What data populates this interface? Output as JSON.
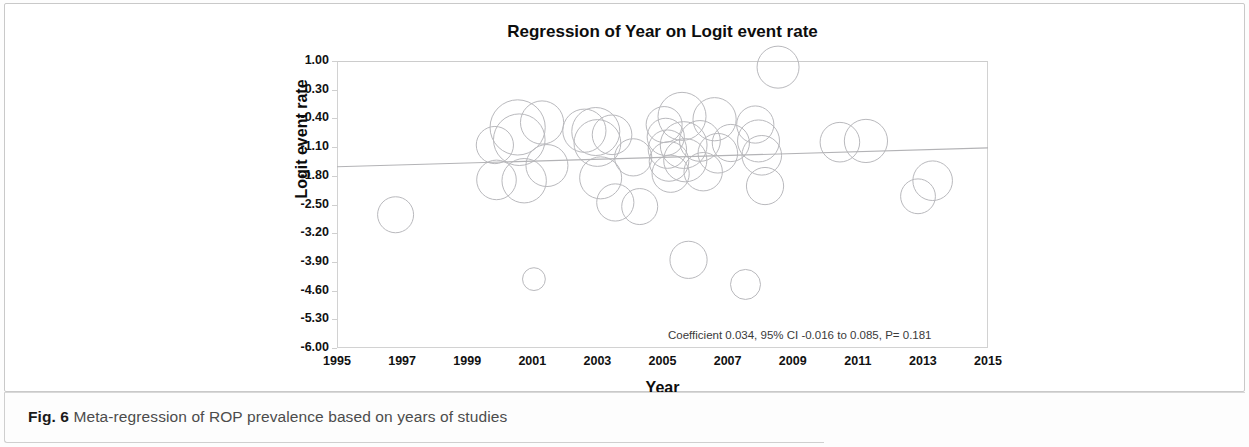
{
  "caption": {
    "label": "Fig. 6",
    "text": " Meta-regression of ROP prevalence based on years of studies"
  },
  "chart_data": {
    "type": "scatter",
    "title": "Regression of Year on Logit event rate",
    "xlabel": "Year",
    "ylabel": "Logit event rate",
    "xlim": [
      1995,
      2015
    ],
    "ylim": [
      -6.0,
      1.0
    ],
    "grid": false,
    "legend": null,
    "xticks": [
      1995,
      1997,
      1999,
      2001,
      2003,
      2005,
      2007,
      2009,
      2011,
      2013,
      2015
    ],
    "xtick_labels": [
      "1995",
      "1997",
      "1999",
      "2001",
      "2003",
      "2005",
      "2007",
      "2009",
      "2011",
      "2013",
      "2015"
    ],
    "yticks": [
      1.0,
      0.3,
      -0.4,
      -1.1,
      -1.8,
      -2.5,
      -3.2,
      -3.9,
      -4.6,
      -5.3,
      -6.0
    ],
    "ytick_labels": [
      "1.00",
      "0.30",
      "-0.40",
      "-1.10",
      "-1.80",
      "-2.50",
      "-3.20",
      "-3.90",
      "-4.60",
      "-5.30",
      "-6.00"
    ],
    "annotation": "Coefficient 0.034, 95% CI -0.016 to 0.085, P= 0.181",
    "statistics": {
      "coefficient": 0.034,
      "ci_lower": -0.016,
      "ci_upper": 0.085,
      "p_value": 0.181,
      "ci_level": "95%"
    },
    "regression_line": {
      "x": [
        1995,
        2015
      ],
      "y": [
        -1.58,
        -1.12
      ],
      "color": "#b3b3b6"
    },
    "marker_style": "open-circle",
    "marker_color": "#b9b9bd",
    "series_name": "Studies",
    "points": [
      {
        "x": 1996.8,
        "y": -2.75,
        "size": 0.6
      },
      {
        "x": 1999.85,
        "y": -1.05,
        "size": 0.62
      },
      {
        "x": 1999.9,
        "y": -1.9,
        "size": 0.66
      },
      {
        "x": 2000.55,
        "y": -0.62,
        "size": 0.92
      },
      {
        "x": 2000.6,
        "y": -0.92,
        "size": 0.86
      },
      {
        "x": 2000.75,
        "y": -1.92,
        "size": 0.74
      },
      {
        "x": 2001.05,
        "y": -4.32,
        "size": 0.38
      },
      {
        "x": 2001.3,
        "y": -0.5,
        "size": 0.72
      },
      {
        "x": 2001.45,
        "y": -1.55,
        "size": 0.7
      },
      {
        "x": 2002.6,
        "y": -0.7,
        "size": 0.72
      },
      {
        "x": 2002.95,
        "y": -0.72,
        "size": 0.8
      },
      {
        "x": 2003.0,
        "y": -1.0,
        "size": 0.78
      },
      {
        "x": 2003.1,
        "y": -1.85,
        "size": 0.7
      },
      {
        "x": 2003.45,
        "y": -0.8,
        "size": 0.66
      },
      {
        "x": 2003.55,
        "y": -2.45,
        "size": 0.62
      },
      {
        "x": 2004.1,
        "y": -1.35,
        "size": 0.62
      },
      {
        "x": 2004.3,
        "y": -2.55,
        "size": 0.6
      },
      {
        "x": 2005.05,
        "y": -0.55,
        "size": 0.6
      },
      {
        "x": 2005.1,
        "y": -0.85,
        "size": 0.62
      },
      {
        "x": 2005.15,
        "y": -1.15,
        "size": 0.64
      },
      {
        "x": 2005.2,
        "y": -1.45,
        "size": 0.66
      },
      {
        "x": 2005.25,
        "y": -1.75,
        "size": 0.62
      },
      {
        "x": 2005.6,
        "y": -0.35,
        "size": 0.8
      },
      {
        "x": 2005.65,
        "y": -1.05,
        "size": 0.78
      },
      {
        "x": 2005.7,
        "y": -1.42,
        "size": 0.72
      },
      {
        "x": 2005.8,
        "y": -3.85,
        "size": 0.62
      },
      {
        "x": 2006.15,
        "y": -0.95,
        "size": 0.68
      },
      {
        "x": 2006.25,
        "y": -1.7,
        "size": 0.64
      },
      {
        "x": 2006.6,
        "y": -0.42,
        "size": 0.72
      },
      {
        "x": 2006.7,
        "y": -1.25,
        "size": 0.66
      },
      {
        "x": 2007.1,
        "y": -1.0,
        "size": 0.62
      },
      {
        "x": 2007.55,
        "y": -4.45,
        "size": 0.5
      },
      {
        "x": 2007.85,
        "y": -0.55,
        "size": 0.62
      },
      {
        "x": 2007.95,
        "y": -0.95,
        "size": 0.7
      },
      {
        "x": 2008.05,
        "y": -1.3,
        "size": 0.66
      },
      {
        "x": 2008.15,
        "y": -2.05,
        "size": 0.62
      },
      {
        "x": 2008.55,
        "y": 0.85,
        "size": 0.7
      },
      {
        "x": 2010.45,
        "y": -0.98,
        "size": 0.66
      },
      {
        "x": 2011.25,
        "y": -0.95,
        "size": 0.72
      },
      {
        "x": 2012.85,
        "y": -2.3,
        "size": 0.58
      },
      {
        "x": 2013.3,
        "y": -1.92,
        "size": 0.66
      }
    ]
  }
}
